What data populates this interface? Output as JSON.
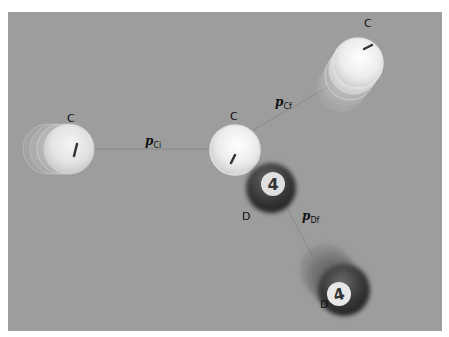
{
  "scene": {
    "background_color": "#9d9d9d",
    "labels": {
      "c_initial": "C",
      "c_collision": "C",
      "c_final": "C",
      "d_collision": "D",
      "d_final": "D"
    },
    "momentum_labels": {
      "p_ci": {
        "symbol": "p",
        "subscript": "Ci"
      },
      "p_cf": {
        "symbol": "p",
        "subscript": "Cf"
      },
      "p_df": {
        "symbol": "p",
        "subscript": "Df"
      }
    },
    "balls": {
      "cue": {
        "name": "cue ball",
        "color": "#f2f2f2",
        "mark": "|"
      },
      "four": {
        "name": "4 ball",
        "color": "#2a2a2a",
        "number": "4"
      }
    }
  }
}
